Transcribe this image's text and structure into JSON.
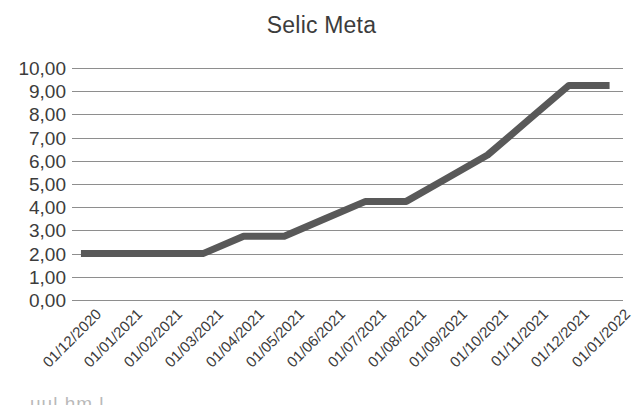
{
  "chart_data": {
    "type": "line",
    "title": "Selic Meta",
    "xlabel": "",
    "ylabel": "",
    "categories": [
      "01/12/2020",
      "01/01/2021",
      "01/02/2021",
      "01/03/2021",
      "01/04/2021",
      "01/05/2021",
      "01/06/2021",
      "01/07/2021",
      "01/08/2021",
      "01/09/2021",
      "01/10/2021",
      "01/11/2021",
      "01/12/2021",
      "01/01/2022"
    ],
    "values": [
      2.0,
      2.0,
      2.0,
      2.0,
      2.75,
      2.75,
      3.5,
      4.25,
      4.25,
      5.25,
      6.25,
      7.75,
      9.25,
      9.25
    ],
    "series": [
      {
        "name": "Selic Meta",
        "color": "#595959",
        "values": [
          2.0,
          2.0,
          2.0,
          2.0,
          2.75,
          2.75,
          3.5,
          4.25,
          4.25,
          5.25,
          6.25,
          7.75,
          9.25,
          9.25
        ]
      }
    ],
    "ylim": [
      0,
      10
    ],
    "ytick_values": [
      0,
      1,
      2,
      3,
      4,
      5,
      6,
      7,
      8,
      9,
      10
    ],
    "ytick_labels": [
      "0,00",
      "1,00",
      "2,00",
      "3,00",
      "4,00",
      "5,00",
      "6,00",
      "7,00",
      "8,00",
      "9,00",
      "10,00"
    ],
    "grid": true,
    "grid_color": "#8e8e8e",
    "legend": false,
    "legend_position": "none",
    "background_color": "#ffffff",
    "line_width": 7,
    "decimal_separator": ","
  },
  "artifact": {
    "bottom_text": "uul hm l"
  }
}
